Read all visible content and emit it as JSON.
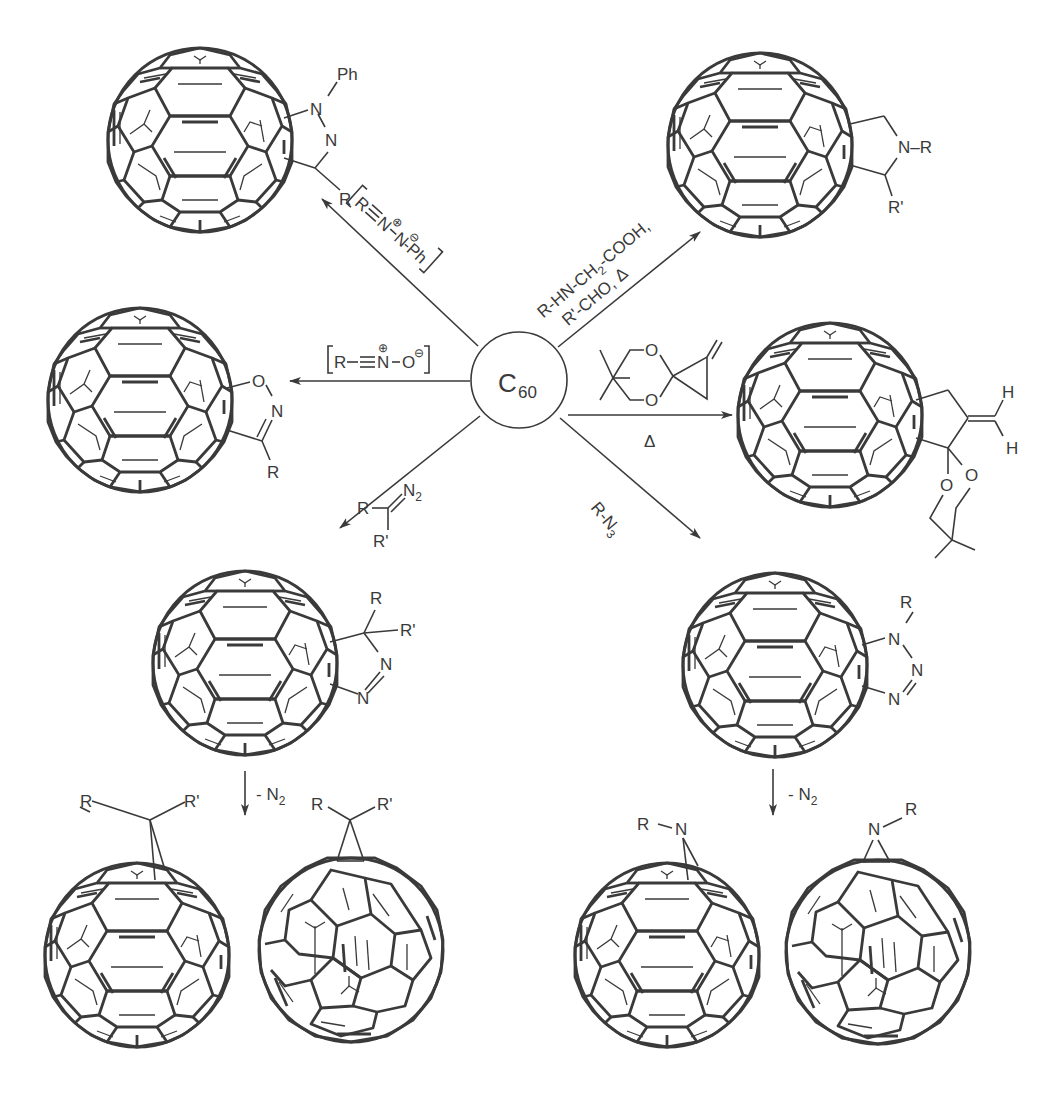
{
  "figure": {
    "type": "reaction-scheme",
    "center": {
      "label": "C",
      "subscript": "60"
    },
    "reactions": [
      {
        "id": "nitrile-imine",
        "direction": "upper-left",
        "reagent": {
          "bracket": true,
          "text": "R≡N⊕–N⊖–Ph",
          "r": "R",
          "n1": "N",
          "n2": "N",
          "ph": "-Ph"
        },
        "product": {
          "name": "pyrazoline",
          "labels": {
            "ph": "Ph",
            "n1": "N",
            "n2": "N",
            "r": "R"
          }
        }
      },
      {
        "id": "azomethine-ylide",
        "direction": "upper-right",
        "reagent": {
          "line1": "R-HN-CH",
          "line1_sub": "2",
          "line1_end": "-COOH,",
          "line2": "R'-CHO,  Δ"
        },
        "product": {
          "name": "pyrrolidine",
          "labels": {
            "n": "N–R",
            "r2": "R'"
          }
        }
      },
      {
        "id": "nitrile-oxide",
        "direction": "left",
        "reagent": {
          "bracket": true,
          "r": "R",
          "n": "N",
          "o": "O",
          "plus": "⊕",
          "minus": "⊖"
        },
        "product": {
          "name": "isoxazoline",
          "labels": {
            "o": "O",
            "n": "N",
            "r": "R"
          }
        }
      },
      {
        "id": "tmm-precursor",
        "direction": "right",
        "reagent": {
          "o1": "O",
          "o2": "O",
          "condition": "Δ"
        },
        "product": {
          "name": "methylenecyclopentane-ketal",
          "labels": {
            "h1": "H",
            "h2": "H",
            "o1": "O",
            "o2": "O"
          }
        }
      },
      {
        "id": "diazo",
        "direction": "lower-left",
        "reagent": {
          "r": "R",
          "r2": "R'",
          "n2": "N",
          "n2_sub": "2"
        },
        "product": {
          "name": "pyrazoline",
          "labels": {
            "r": "R",
            "r2": "R'",
            "n1": "N",
            "n2": "N"
          }
        },
        "followup": {
          "condition": "- N",
          "condition_sub": "2",
          "products": [
            {
              "name": "fulleroid",
              "labels": {
                "r": "R",
                "r2": "R'"
              }
            },
            {
              "name": "methanofullerene",
              "labels": {
                "r": "R",
                "r2": "R'"
              }
            }
          ]
        }
      },
      {
        "id": "azide",
        "direction": "lower-right",
        "reagent": {
          "text": "R-N",
          "sub": "3"
        },
        "product": {
          "name": "triazoline",
          "labels": {
            "r": "R",
            "n1": "N",
            "n2": "N",
            "n3": "N"
          }
        },
        "followup": {
          "condition": "- N",
          "condition_sub": "2",
          "products": [
            {
              "name": "azafulleroid",
              "labels": {
                "r": "R",
                "n": "N"
              }
            },
            {
              "name": "aziridinofullerene",
              "labels": {
                "r": "R",
                "n": "N"
              }
            }
          ]
        }
      }
    ]
  },
  "colors": {
    "ink": "#3a3a3a",
    "background": "#ffffff"
  }
}
